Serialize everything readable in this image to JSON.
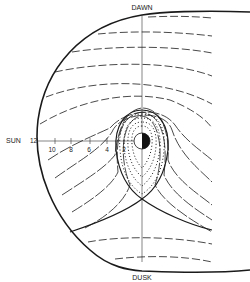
{
  "diagram": {
    "labels": {
      "top": "DAWN",
      "bottom": "DUSK",
      "left": "SUN"
    },
    "axis_ticks": [
      "12",
      "10",
      "8",
      "6",
      "4",
      "2"
    ],
    "colors": {
      "line": "#1a1a1a",
      "background": "#ffffff",
      "earth_night": "#111111"
    }
  }
}
